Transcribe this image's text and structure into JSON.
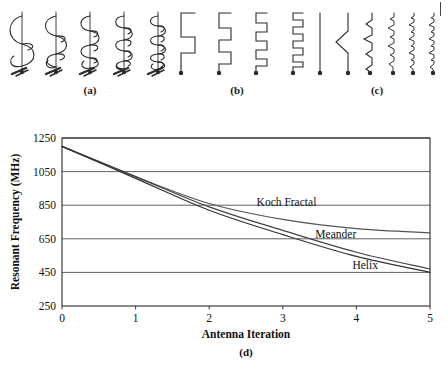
{
  "figure": {
    "panels": [
      {
        "key": "a",
        "label": "(a)",
        "name": "helix-antenna-series",
        "description": "Helix antenna iterations with increasing number of turns",
        "icon": "helix-antenna-icon",
        "items": [
          {
            "turns": 2,
            "label": "helix-iteration-0"
          },
          {
            "turns": 3,
            "label": "helix-iteration-1"
          },
          {
            "turns": 4,
            "label": "helix-iteration-2"
          },
          {
            "turns": 5,
            "label": "helix-iteration-3"
          },
          {
            "turns": 6,
            "label": "helix-iteration-4"
          }
        ]
      },
      {
        "key": "b",
        "label": "(b)",
        "name": "meander-antenna-series",
        "description": "Meander line antenna iterations with increasing number of bends",
        "icon": "meander-antenna-icon",
        "items": [
          {
            "bends": 1,
            "label": "meander-iteration-0"
          },
          {
            "bends": 2,
            "label": "meander-iteration-1"
          },
          {
            "bends": 3,
            "label": "meander-iteration-2"
          },
          {
            "bends": 5,
            "label": "meander-iteration-3"
          }
        ]
      },
      {
        "key": "c",
        "label": "(c)",
        "name": "koch-fractal-antenna-series",
        "description": "Koch fractal antenna iterations from straight monopole to higher order fractal",
        "icon": "koch-fractal-antenna-icon",
        "items": [
          {
            "order": 0,
            "label": "koch-iteration-0"
          },
          {
            "order": 1,
            "label": "koch-iteration-1"
          },
          {
            "order": 2,
            "label": "koch-iteration-2"
          },
          {
            "order": 3,
            "label": "koch-iteration-3"
          },
          {
            "order": 4,
            "label": "koch-iteration-4"
          },
          {
            "order": 5,
            "label": "koch-iteration-5"
          }
        ]
      }
    ],
    "chart_label": "(d)"
  },
  "chart_data": {
    "type": "line",
    "title": "",
    "xlabel": "Antenna Iteration",
    "ylabel": "Resonant Frequency (MHz)",
    "x": [
      0,
      1,
      2,
      3,
      4,
      5
    ],
    "xlim": [
      0,
      5
    ],
    "ylim": [
      250,
      1250
    ],
    "xticks": [
      "0",
      "1",
      "2",
      "3",
      "4",
      "5"
    ],
    "yticks": [
      "250",
      "450",
      "650",
      "850",
      "1050",
      "1250"
    ],
    "grid": "horizontal",
    "legend": "inline-annotations",
    "series": [
      {
        "name": "Koch Fractal",
        "color": "#555555",
        "values": [
          1200,
          1020,
          860,
          765,
          710,
          685
        ],
        "label_x": 3.05,
        "label_y": 845
      },
      {
        "name": "Meander",
        "color": "#444444",
        "values": [
          1200,
          1020,
          840,
          700,
          570,
          470
        ],
        "label_x": 3.72,
        "label_y": 655
      },
      {
        "name": "Helix",
        "color": "#333333",
        "values": [
          1200,
          1010,
          820,
          675,
          545,
          450
        ],
        "label_x": 4.12,
        "label_y": 470
      }
    ]
  }
}
